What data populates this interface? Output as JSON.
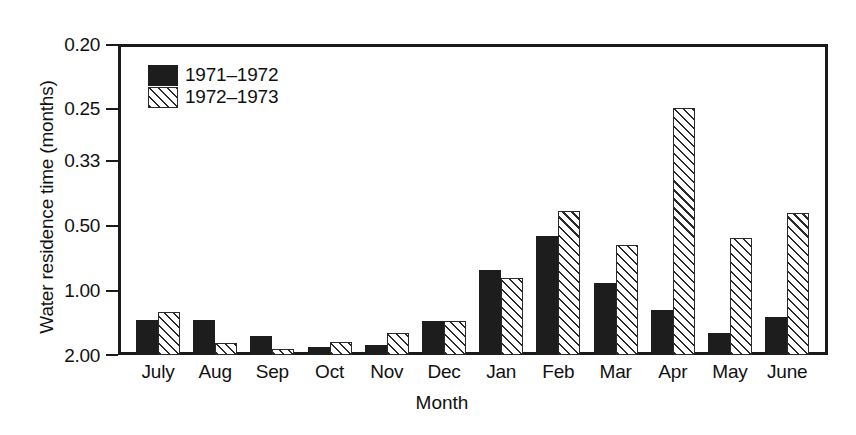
{
  "chart_data": {
    "type": "bar",
    "title": "",
    "subtitle": "",
    "xlabel": "Month",
    "ylabel": "Water residence time (months)",
    "categories": [
      "July",
      "Aug",
      "Sep",
      "Oct",
      "Nov",
      "Dec",
      "Jan",
      "Feb",
      "Mar",
      "Apr",
      "May",
      "June"
    ],
    "yticks": [
      "0.20",
      "0.25",
      "0.33",
      "0.50",
      "1.00",
      "2.00"
    ],
    "ytick_values": [
      0.2,
      0.25,
      0.33,
      0.5,
      1.0,
      2.0
    ],
    "y_scale": "reciprocal (linear in 1/y); axis inverted so smaller residence time is higher",
    "ylim": [
      2.0,
      0.2
    ],
    "grid": false,
    "legend_position": "top-left inside axes",
    "series": [
      {
        "name": "1971–1972",
        "style": "solid-black",
        "values": [
          1.29,
          1.3,
          1.72,
          1.92,
          1.89,
          1.29,
          0.83,
          0.53,
          0.92,
          1.18,
          1.49,
          1.26
        ]
      },
      {
        "name": "1972–1973",
        "style": "diagonal-hatch",
        "values": [
          1.18,
          1.82,
          1.98,
          1.82,
          1.67,
          1.29,
          0.89,
          0.44,
          0.58,
          0.22,
          0.55,
          0.44
        ]
      }
    ]
  },
  "axis": {
    "ylabel": "Water residence time (months)",
    "xlabel": "Month",
    "yticks": [
      {
        "label": "0.20",
        "y": 44
      },
      {
        "label": "0.25",
        "y": 108
      },
      {
        "label": "0.33",
        "y": 160
      },
      {
        "label": "0.50",
        "y": 225
      },
      {
        "label": "1.00",
        "y": 290
      },
      {
        "label": "2.00",
        "y": 355
      }
    ]
  },
  "legend": {
    "items": [
      {
        "label": "1971–1972",
        "style": "solid"
      },
      {
        "label": "1972–1973",
        "style": "hatch"
      }
    ]
  },
  "bars": {
    "groups": [
      {
        "category": "July",
        "solid_h": 35,
        "hatch_h": 43
      },
      {
        "category": "Aug",
        "solid_h": 35,
        "hatch_h": 12
      },
      {
        "category": "Sep",
        "solid_h": 19,
        "hatch_h": 6
      },
      {
        "category": "Oct",
        "solid_h": 8,
        "hatch_h": 13
      },
      {
        "category": "Nov",
        "solid_h": 10,
        "hatch_h": 22
      },
      {
        "category": "Dec",
        "solid_h": 34,
        "hatch_h": 34
      },
      {
        "category": "Jan",
        "solid_h": 85,
        "hatch_h": 77
      },
      {
        "category": "Feb",
        "solid_h": 119,
        "hatch_h": 144
      },
      {
        "category": "Mar",
        "solid_h": 72,
        "hatch_h": 110
      },
      {
        "category": "Apr",
        "solid_h": 45,
        "hatch_h": 247
      },
      {
        "category": "May",
        "solid_h": 22,
        "hatch_h": 117
      },
      {
        "category": "June",
        "solid_h": 38,
        "hatch_h": 142
      }
    ]
  }
}
